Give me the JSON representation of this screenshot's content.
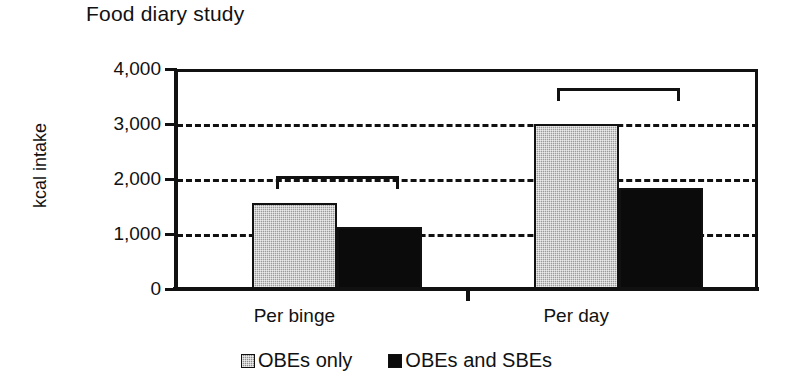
{
  "chart_data": {
    "type": "bar",
    "title": "Food diary study",
    "xlabel": "",
    "ylabel": "kcal intake",
    "categories": [
      "Per binge",
      "Per day"
    ],
    "series": [
      {
        "name": "OBEs only",
        "values": [
          1560,
          3000
        ],
        "color": "#9a9a9a",
        "swatch": "grey"
      },
      {
        "name": "OBEs and SBEs",
        "values": [
          1120,
          1835
        ],
        "color": "#0b0b0b",
        "swatch": "black"
      }
    ],
    "ylim": [
      0,
      4000
    ],
    "y_ticks": [
      0,
      1000,
      2000,
      3000,
      4000
    ],
    "y_tick_labels": [
      "0",
      "1,000",
      "2,000",
      "3,000",
      "4,000"
    ],
    "grid": "horizontal-dashed",
    "legend_position": "bottom-center",
    "annotations": [
      {
        "name": "significance-bracket-per-binge",
        "group": "Per binge",
        "y": 2050
      },
      {
        "name": "significance-bracket-per-day",
        "group": "Per day",
        "y": 3650
      }
    ]
  },
  "axis": {
    "y_label": "kcal intake",
    "ticks": [
      {
        "label": "4,000",
        "value": 4000
      },
      {
        "label": "3,000",
        "value": 3000
      },
      {
        "label": "2,000",
        "value": 2000
      },
      {
        "label": "1,000",
        "value": 1000
      },
      {
        "label": "0",
        "value": 0
      }
    ]
  },
  "groups": [
    {
      "label": "Per binge",
      "center_pct": 27.5
    },
    {
      "label": "Per day",
      "center_pct": 76.0
    }
  ],
  "legend": {
    "entries": [
      {
        "label": "OBEs only",
        "swatch": "grey"
      },
      {
        "label": "OBEs and SBEs",
        "swatch": "black"
      }
    ]
  }
}
